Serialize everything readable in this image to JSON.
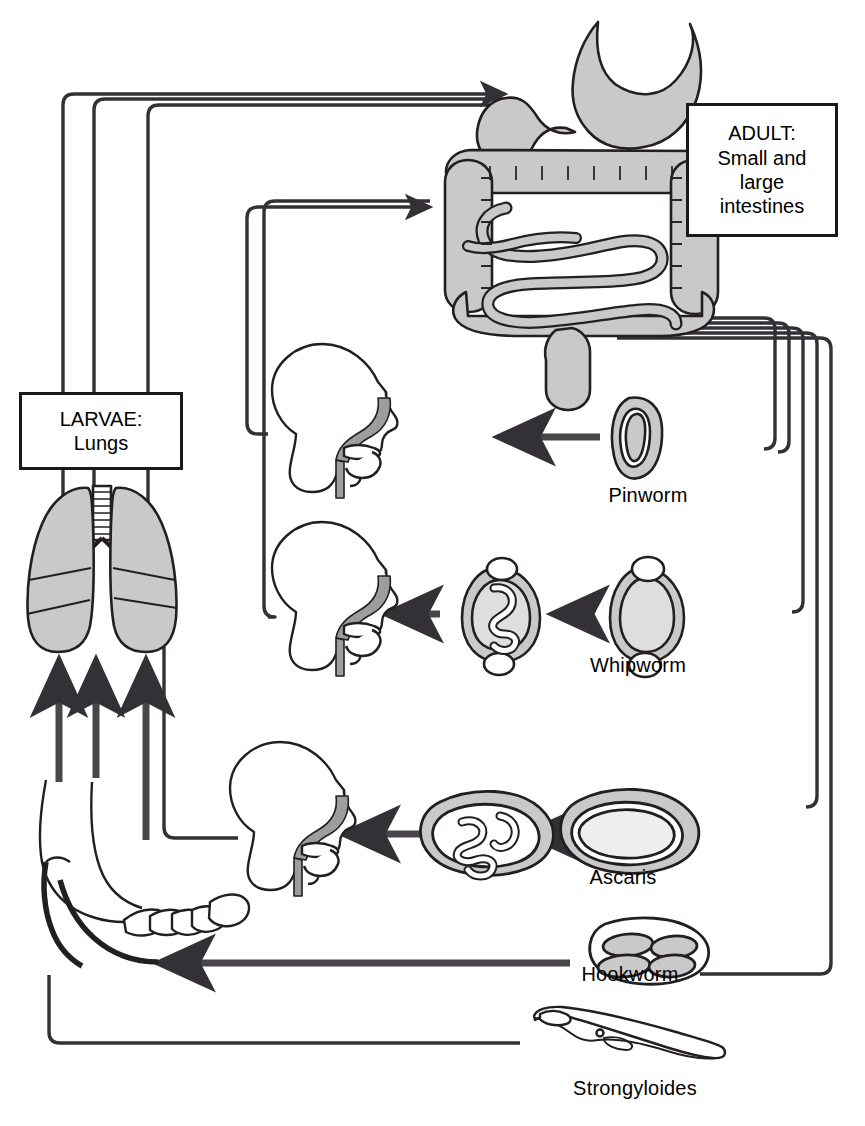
{
  "diagram": {
    "colors": {
      "stroke": "#231f20",
      "organ_fill": "#c9c9c9",
      "egg_fill": "#cfcfcf",
      "background": "#ffffff"
    },
    "boxes": [
      {
        "id": "adult",
        "lines": [
          "ADULT:",
          "Small and",
          "large",
          "intestines"
        ]
      },
      {
        "id": "larvae",
        "lines": [
          "LARVAE:",
          "Lungs"
        ]
      }
    ],
    "organs": [
      {
        "name": "stomach-and-intestines",
        "label": ""
      },
      {
        "name": "lungs",
        "label": ""
      },
      {
        "name": "head-mouth-pharynx-1",
        "label": ""
      },
      {
        "name": "head-mouth-pharynx-2",
        "label": ""
      },
      {
        "name": "head-mouth-pharynx-3",
        "label": ""
      },
      {
        "name": "foot",
        "label": ""
      }
    ],
    "parasites": [
      {
        "id": "pinworm",
        "label": "Pinworm",
        "stage": "embryonated-egg"
      },
      {
        "id": "whipworm",
        "label": "Whipworm",
        "stage": "unembryonated-egg"
      },
      {
        "id": "whipworm_emb",
        "label": "",
        "stage": "embryonated-egg"
      },
      {
        "id": "ascaris",
        "label": "Ascaris",
        "stage": "unembryonated-egg"
      },
      {
        "id": "ascaris_emb",
        "label": "",
        "stage": "embryonated-egg"
      },
      {
        "id": "hookworm",
        "label": "Hookworm",
        "stage": "egg-with-blastomeres"
      },
      {
        "id": "strongyloides",
        "label": "Strongyloides",
        "stage": "filariform-larva"
      }
    ],
    "flow": [
      {
        "from": "lungs",
        "to": "intestines",
        "style": "pipe"
      },
      {
        "from": "mouth-1",
        "to": "intestines",
        "style": "pipe"
      },
      {
        "from": "mouth-2",
        "to": "intestines",
        "style": "pipe"
      },
      {
        "from": "intestines",
        "to": "pinworm",
        "style": "pipe"
      },
      {
        "from": "intestines",
        "to": "whipworm",
        "style": "pipe"
      },
      {
        "from": "intestines",
        "to": "ascaris",
        "style": "pipe"
      },
      {
        "from": "intestines",
        "to": "hookworm",
        "style": "pipe"
      },
      {
        "from": "intestines",
        "to": "strongyloides",
        "style": "pipe"
      },
      {
        "from": "pinworm",
        "to": "mouth-1",
        "style": "arrow"
      },
      {
        "from": "whipworm",
        "to": "whipworm-egg",
        "style": "arrow"
      },
      {
        "from": "whipworm-egg",
        "to": "mouth-2",
        "style": "arrow"
      },
      {
        "from": "ascaris",
        "to": "ascaris-egg",
        "style": "arrow"
      },
      {
        "from": "ascaris-egg",
        "to": "mouth-3",
        "style": "arrow"
      },
      {
        "from": "mouth-3",
        "to": "lungs",
        "style": "pipe"
      },
      {
        "from": "hookworm",
        "to": "foot",
        "style": "arrow"
      },
      {
        "from": "strongyloides",
        "to": "foot",
        "style": "pipe"
      },
      {
        "from": "foot",
        "to": "lungs",
        "style": "arrow"
      }
    ]
  }
}
